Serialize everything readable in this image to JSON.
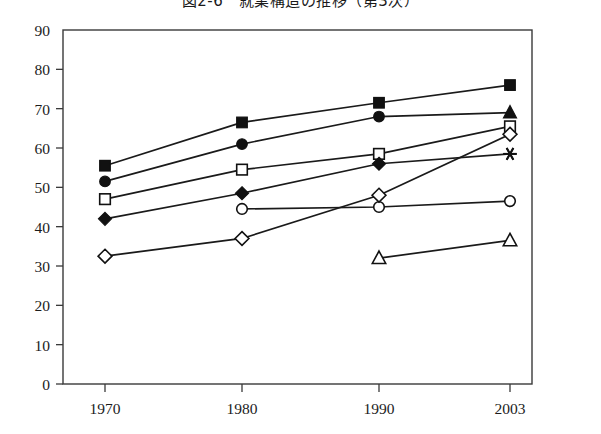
{
  "title": "図2-6　就業構造の推移（第3次）",
  "chart_data": {
    "type": "line",
    "title": "図2-6　就業構造の推移（第3次）",
    "xlabel": "",
    "ylabel": "",
    "x": [
      "1970",
      "1980",
      "1990",
      "2003"
    ],
    "categories": [
      "1970",
      "1980",
      "1990",
      "2003"
    ],
    "xlim": [
      0,
      3
    ],
    "ylim": [
      0,
      90
    ],
    "ytick_labels": [
      "0",
      "10",
      "20",
      "30",
      "40",
      "50",
      "60",
      "70",
      "80",
      "90"
    ],
    "yticks": [
      0,
      10,
      20,
      30,
      40,
      50,
      60,
      70,
      80,
      90
    ],
    "xtick_labels": [
      "1970",
      "1980",
      "1990",
      "2003"
    ],
    "grid": false,
    "legend": "none",
    "line_color": "#1a1a1a",
    "series": [
      {
        "name": "series-filled-square",
        "marker": "filled-square",
        "filled": true,
        "x": [
          "1970",
          "1980",
          "1990",
          "2003"
        ],
        "values": [
          55.5,
          66.5,
          71.5,
          76.0
        ]
      },
      {
        "name": "series-filled-circle-triangle",
        "marker": "filled-circle",
        "end_marker": "filled-triangle",
        "filled": true,
        "x": [
          "1970",
          "1980",
          "1990",
          "2003"
        ],
        "values": [
          51.5,
          61.0,
          68.0,
          69.0
        ]
      },
      {
        "name": "series-open-square",
        "marker": "open-square",
        "filled": false,
        "x": [
          "1970",
          "1980",
          "1990",
          "2003"
        ],
        "values": [
          47.0,
          54.5,
          58.5,
          65.5
        ]
      },
      {
        "name": "series-filled-diamond-asterisk",
        "marker": "filled-diamond",
        "end_marker": "asterisk",
        "filled": true,
        "x": [
          "1970",
          "1980",
          "1990",
          "2003"
        ],
        "values": [
          42.0,
          48.5,
          56.0,
          58.5
        ]
      },
      {
        "name": "series-open-circle",
        "marker": "open-circle",
        "filled": false,
        "x": [
          "1980",
          "1990",
          "2003"
        ],
        "values": [
          44.5,
          45.0,
          46.5
        ]
      },
      {
        "name": "series-open-diamond",
        "marker": "open-diamond",
        "filled": false,
        "x": [
          "1970",
          "1980",
          "1990",
          "2003"
        ],
        "values": [
          32.5,
          37.0,
          48.0,
          63.5
        ]
      },
      {
        "name": "series-open-triangle",
        "marker": "open-triangle",
        "filled": false,
        "x": [
          "1990",
          "2003"
        ],
        "values": [
          32.0,
          36.5
        ]
      }
    ]
  }
}
